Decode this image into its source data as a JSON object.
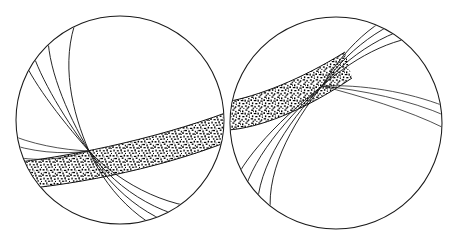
{
  "figure": {
    "background_color": "#ffffff",
    "ink_color": "#1a1a1a",
    "stipple_color": "#000000",
    "width": 462,
    "height": 238
  },
  "chart_data": {
    "type": "diagram",
    "title": "",
    "xlabel": "",
    "ylabel": "",
    "grid": false,
    "legend": null,
    "objects": [
      {
        "name": "left-sphere",
        "shape": "circle",
        "center": [
          120,
          120
        ],
        "radius": 104,
        "convergence_point": [
          89,
          151
        ],
        "band": {
          "label": "stipple-band",
          "texture": "random-dot-stipple",
          "start_edge_y": 134,
          "end_edge_y": 170,
          "direction": "rises to the right",
          "color": "#000000"
        },
        "arc_groups": [
          {
            "name": "upper-left-fan",
            "count": 4,
            "direction": "up-left from node toward sphere limb"
          },
          {
            "name": "lower-right-fan",
            "count": 4,
            "direction": "down-right from node toward sphere limb"
          },
          {
            "name": "near-horizontal-lines",
            "count": 3,
            "direction": "left from node toward left limb"
          }
        ]
      },
      {
        "name": "right-sphere",
        "shape": "circle",
        "center": [
          336,
          123
        ],
        "radius": 106,
        "convergence_point": [
          322,
          86
        ],
        "band": {
          "label": "stipple-band",
          "texture": "random-dot-stipple",
          "start_edge_y": 80,
          "end_edge_y": 120,
          "direction": "rises to the right",
          "color": "#000000"
        },
        "arc_groups": [
          {
            "name": "upper-right-fan",
            "count": 4,
            "direction": "up-right from node toward sphere limb"
          },
          {
            "name": "lower-left-fan",
            "count": 4,
            "direction": "down-left from node toward sphere limb"
          },
          {
            "name": "near-horizontal-lines",
            "count": 3,
            "direction": "right from node toward right limb"
          }
        ]
      }
    ],
    "annotations": [],
    "tick_labels": [],
    "values": []
  }
}
